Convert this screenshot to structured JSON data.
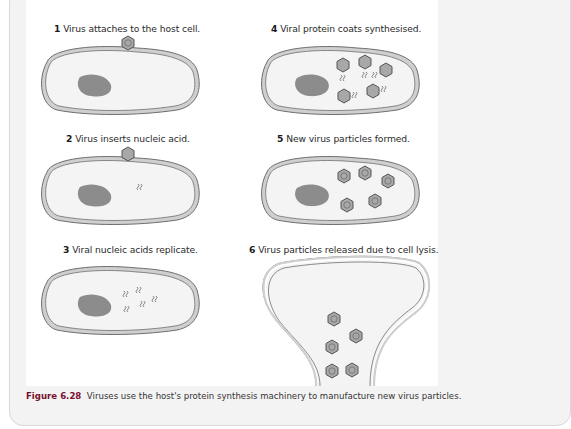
{
  "figure": {
    "number": "Figure 6.28",
    "caption": "Viruses use the host's protein synthesis machinery to manufacture new virus particles."
  },
  "steps": [
    {
      "num": "1",
      "text": "Virus attaches to the host cell."
    },
    {
      "num": "2",
      "text": "Virus inserts nucleic acid."
    },
    {
      "num": "3",
      "text": "Viral nucleic acids replicate."
    },
    {
      "num": "4",
      "text": "Viral protein coats synthesised."
    },
    {
      "num": "5",
      "text": "New virus particles formed."
    },
    {
      "num": "6",
      "text": "Virus particles released due to cell lysis."
    }
  ],
  "colors": {
    "membrane_outer": "#6e6e6e",
    "membrane_fill": "#cfcfcf",
    "cytoplasm": "#f4f4f4",
    "nucleus": "#8c8c8c",
    "virus": "#a8a8a8",
    "caption_accent": "#7a1030"
  }
}
